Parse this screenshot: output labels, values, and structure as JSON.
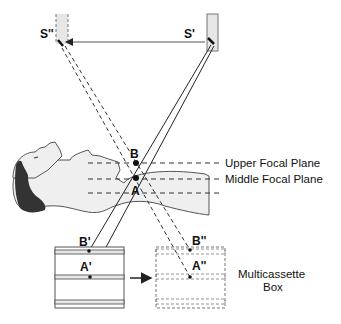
{
  "diagram": {
    "labels": {
      "source_prime": "S'",
      "source_double_prime": "S''",
      "point_b": "B",
      "point_a": "A",
      "image_b_prime": "B'",
      "image_a_prime": "A'",
      "image_b_double_prime": "B''",
      "image_a_double_prime": "A''"
    },
    "planes": [
      {
        "label": "Upper Focal Plane"
      },
      {
        "label": "Middle Focal Plane"
      },
      {
        "label": ""
      }
    ],
    "box_label_line1": "Multicassette",
    "box_label_line2": "Box",
    "colors": {
      "line": "#222222",
      "tube_fill": "#e6e6e6",
      "body_fill": "#efefef",
      "hair": "#333333",
      "cassette_fill": "#e8e8e8"
    }
  }
}
